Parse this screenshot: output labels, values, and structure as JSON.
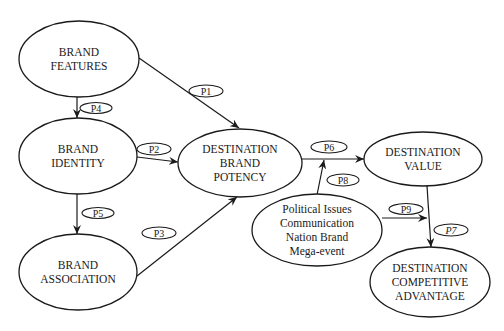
{
  "colors": {
    "background": "#ffffff",
    "stroke": "#1a1a1a",
    "text": "#1a1a1a"
  },
  "nodes": [
    {
      "id": "brand_features",
      "lines": [
        "BRAND",
        "FEATURES"
      ],
      "cx": 79,
      "cy": 59,
      "rx": 60,
      "ry": 38
    },
    {
      "id": "brand_identity",
      "lines": [
        "BRAND",
        "IDENTITY"
      ],
      "cx": 78,
      "cy": 156,
      "rx": 59,
      "ry": 38
    },
    {
      "id": "brand_association",
      "lines": [
        "BRAND",
        "ASSOCIATION"
      ],
      "cx": 78,
      "cy": 272,
      "rx": 59,
      "ry": 38
    },
    {
      "id": "destination_brand_potency",
      "lines": [
        "DESTINATION",
        "BRAND",
        "POTENCY"
      ],
      "cx": 240,
      "cy": 163,
      "rx": 62,
      "ry": 34
    },
    {
      "id": "destination_value",
      "lines": [
        "DESTINATION",
        "VALUE"
      ],
      "cx": 423,
      "cy": 159,
      "rx": 59,
      "ry": 27
    },
    {
      "id": "moderators",
      "lines": [
        "Political Issues",
        "Communication",
        "Nation Brand",
        "Mega-event"
      ],
      "cx": 317,
      "cy": 230,
      "rx": 65,
      "ry": 36
    },
    {
      "id": "destination_competitive_advantage",
      "lines": [
        "DESTINATION",
        "COMPETITIVE",
        "ADVANTAGE"
      ],
      "cx": 430,
      "cy": 282,
      "rx": 60,
      "ry": 35
    }
  ],
  "edges": [
    {
      "id": "P1",
      "from": "brand_features",
      "to": "destination_brand_potency",
      "x1": 139,
      "y1": 58,
      "x2": 239,
      "y2": 128
    },
    {
      "id": "P2",
      "from": "brand_identity",
      "to": "destination_brand_potency",
      "x1": 137,
      "y1": 157,
      "x2": 178,
      "y2": 162
    },
    {
      "id": "P3",
      "from": "brand_association",
      "to": "destination_brand_potency",
      "x1": 137,
      "y1": 276,
      "x2": 237,
      "y2": 197
    },
    {
      "id": "P4",
      "from": "brand_features",
      "to": "brand_identity",
      "x1": 77,
      "y1": 97,
      "x2": 77,
      "y2": 118
    },
    {
      "id": "P5",
      "from": "brand_identity",
      "to": "brand_association",
      "x1": 77,
      "y1": 194,
      "x2": 77,
      "y2": 234
    },
    {
      "id": "P6",
      "from": "destination_brand_potency",
      "to": "destination_value",
      "x1": 302,
      "y1": 159,
      "x2": 364,
      "y2": 159
    },
    {
      "id": "P7",
      "from": "destination_value",
      "to": "destination_competitive_advantage",
      "x1": 427,
      "y1": 186,
      "x2": 431,
      "y2": 247
    },
    {
      "id": "P8",
      "from": "moderators",
      "to": "P6-edge",
      "x1": 317,
      "y1": 195,
      "x2": 324,
      "y2": 160
    },
    {
      "id": "P9",
      "from": "moderators",
      "to": "P7-edge",
      "x1": 382,
      "y1": 218,
      "x2": 427,
      "y2": 218
    }
  ],
  "labels": [
    {
      "id": "P1",
      "text": "P1",
      "cx": 206,
      "cy": 91,
      "rx": 17,
      "ry": 6,
      "italic": false
    },
    {
      "id": "P2",
      "text": "P2",
      "cx": 154,
      "cy": 149,
      "rx": 17,
      "ry": 6,
      "italic": false
    },
    {
      "id": "P3",
      "text": "P3",
      "cx": 159,
      "cy": 233,
      "rx": 17,
      "ry": 6,
      "italic": false
    },
    {
      "id": "P4",
      "text": "P4",
      "cx": 96,
      "cy": 108,
      "rx": 16,
      "ry": 5.5,
      "italic": false
    },
    {
      "id": "P5",
      "text": "P5",
      "cx": 98,
      "cy": 213,
      "rx": 16,
      "ry": 5.5,
      "italic": false
    },
    {
      "id": "P6",
      "text": "P6",
      "cx": 329,
      "cy": 147,
      "rx": 18,
      "ry": 6,
      "italic": false
    },
    {
      "id": "P7",
      "text": "P7",
      "cx": 451,
      "cy": 230,
      "rx": 17,
      "ry": 6,
      "italic": true
    },
    {
      "id": "P8",
      "text": "P8",
      "cx": 343,
      "cy": 180,
      "rx": 16,
      "ry": 6,
      "italic": false
    },
    {
      "id": "P9",
      "text": "P9",
      "cx": 406,
      "cy": 209,
      "rx": 17,
      "ry": 5.5,
      "italic": false
    }
  ]
}
